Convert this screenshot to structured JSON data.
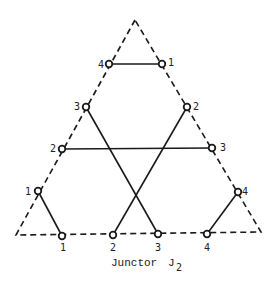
{
  "diagram": {
    "title": "Junctor",
    "subscript": "2",
    "colors": {
      "line": "#1a1a1a",
      "background": "#ffffff"
    },
    "triangle": {
      "apex": [
        135,
        20
      ],
      "bottom_left": [
        16,
        235
      ],
      "bottom_right": [
        261,
        232
      ],
      "style": "dashed"
    },
    "nodes": {
      "top_4": {
        "x": 109,
        "y": 64,
        "label": "4"
      },
      "top_1": {
        "x": 162,
        "y": 64,
        "label": "1"
      },
      "left_3": {
        "x": 86,
        "y": 107,
        "label": "3"
      },
      "right_2": {
        "x": 187,
        "y": 107,
        "label": "2"
      },
      "left_2": {
        "x": 62,
        "y": 149,
        "label": "2"
      },
      "right_3": {
        "x": 212,
        "y": 148,
        "label": "3"
      },
      "left_1": {
        "x": 38,
        "y": 191,
        "label": "1"
      },
      "right_4": {
        "x": 238,
        "y": 192,
        "label": "4"
      },
      "bottom_1": {
        "x": 62,
        "y": 236,
        "label": "1"
      },
      "bottom_2": {
        "x": 113,
        "y": 235,
        "label": "2"
      },
      "bottom_3": {
        "x": 158,
        "y": 234,
        "label": "3"
      },
      "bottom_4": {
        "x": 207,
        "y": 234,
        "label": "4"
      }
    },
    "edges": [
      [
        "top_4",
        "top_1"
      ],
      [
        "left_3",
        "bottom_3"
      ],
      [
        "right_2",
        "bottom_2"
      ],
      [
        "left_2",
        "right_3"
      ],
      [
        "left_1",
        "bottom_1"
      ],
      [
        "right_4",
        "bottom_4"
      ]
    ]
  }
}
